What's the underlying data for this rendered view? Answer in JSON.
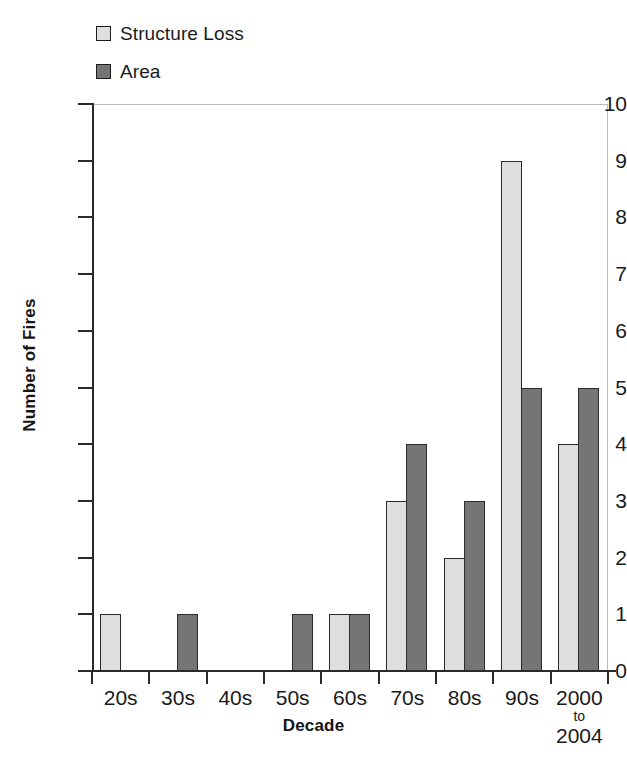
{
  "chart_data": {
    "type": "bar",
    "title": "",
    "xlabel": "Decade",
    "ylabel": "Number of Fires",
    "ylim": [
      0,
      10
    ],
    "ytick_values": [
      0,
      1,
      2,
      3,
      4,
      5,
      6,
      7,
      8,
      9,
      10
    ],
    "ytick_labels": [
      "0",
      "1",
      "2",
      "3",
      "4",
      "5",
      "6",
      "7",
      "8",
      "9",
      "10"
    ],
    "grid": false,
    "legend_position": "top-left",
    "categories": [
      "20s",
      "30s",
      "40s",
      "50s",
      "60s",
      "70s",
      "80s",
      "90s",
      "2000 to 2004"
    ],
    "category_labels": [
      {
        "lines": [
          "20s"
        ]
      },
      {
        "lines": [
          "30s"
        ]
      },
      {
        "lines": [
          "40s"
        ]
      },
      {
        "lines": [
          "50s"
        ]
      },
      {
        "lines": [
          "60s"
        ]
      },
      {
        "lines": [
          "70s"
        ]
      },
      {
        "lines": [
          "80s"
        ]
      },
      {
        "lines": [
          "90s"
        ]
      },
      {
        "lines": [
          "2000",
          "to",
          "2004"
        ]
      }
    ],
    "series": [
      {
        "name": "Structure Loss",
        "color": "#dedede",
        "values": [
          1,
          0,
          0,
          0,
          1,
          3,
          2,
          9,
          4
        ]
      },
      {
        "name": "Area",
        "color": "#757575",
        "values": [
          0,
          1,
          0,
          1,
          1,
          4,
          3,
          5,
          5
        ]
      }
    ]
  },
  "legend": {
    "entries": [
      {
        "label": "Structure Loss",
        "swatch_class": "series-structure"
      },
      {
        "label": "Area",
        "swatch_class": "series-area"
      }
    ]
  },
  "axes": {
    "y_title": "Number of Fires",
    "x_title": "Decade"
  },
  "colors": {
    "structure_loss": "#dedede",
    "area": "#757575",
    "axis": "#2a2a2a",
    "frame": "#b9b9b9",
    "bar_outline": "#2b2b2b",
    "background": "#ffffff"
  }
}
